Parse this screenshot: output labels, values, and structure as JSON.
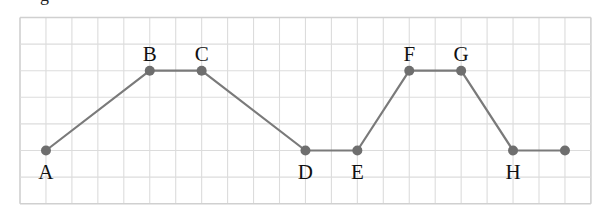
{
  "caption": {
    "fragment": "g"
  },
  "grid": {
    "left": 20,
    "top": 17.5,
    "cols": 22,
    "rows": 7,
    "cell_w": 25.95,
    "cell_h": 26.6,
    "line_color": "#dcdcdc",
    "border_color": "#d0d0d0"
  },
  "style": {
    "line_color": "#7a7a7a",
    "point_color": "#6e6e6e",
    "label_color": "#111111",
    "point_radius": 5,
    "line_width": 2.2
  },
  "points": [
    {
      "label": "A",
      "col": 1,
      "row": 5,
      "label_pos": "below"
    },
    {
      "label": "B",
      "col": 5,
      "row": 2,
      "label_pos": "above"
    },
    {
      "label": "C",
      "col": 7,
      "row": 2,
      "label_pos": "above"
    },
    {
      "label": "D",
      "col": 11,
      "row": 5,
      "label_pos": "below"
    },
    {
      "label": "E",
      "col": 13,
      "row": 5,
      "label_pos": "below"
    },
    {
      "label": "F",
      "col": 15,
      "row": 2,
      "label_pos": "above"
    },
    {
      "label": "G",
      "col": 17,
      "row": 2,
      "label_pos": "above"
    },
    {
      "label": "H",
      "col": 19,
      "row": 5,
      "label_pos": "below"
    },
    {
      "label": "",
      "col": 21,
      "row": 5,
      "label_pos": "none"
    }
  ]
}
